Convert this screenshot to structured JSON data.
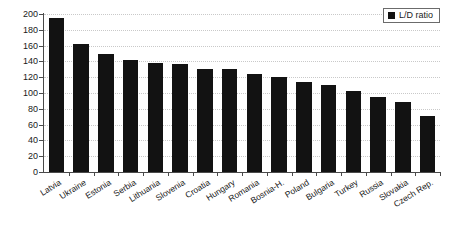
{
  "chart_data": {
    "type": "bar",
    "title": "",
    "xlabel": "",
    "ylabel": "",
    "ylim": [
      0,
      200
    ],
    "ytick_step": 20,
    "grid": true,
    "legend_position": "top-right",
    "series": [
      {
        "name": "L/D ratio",
        "color": "#121212",
        "values": [
          195,
          162,
          149,
          142,
          138,
          137,
          131,
          130,
          124,
          120,
          114,
          110,
          103,
          95,
          88,
          71
        ]
      }
    ],
    "categories": [
      "Latvia",
      "Ukraine",
      "Estonia",
      "Serbia",
      "Lithuania",
      "Slovenia",
      "Croatia",
      "Hungary",
      "Romania",
      "Bosnia-H.",
      "Poland",
      "Bulgaria",
      "Turkey",
      "Russia",
      "Slovakia",
      "Czech Rep."
    ],
    "ytick_labels": [
      "0",
      "20",
      "40",
      "60",
      "80",
      "100",
      "120",
      "140",
      "160",
      "180",
      "200"
    ],
    "ytick_values": [
      0,
      20,
      40,
      60,
      80,
      100,
      120,
      140,
      160,
      180,
      200
    ]
  },
  "legend": {
    "entries": [
      {
        "label": "L/D ratio",
        "color": "#121212",
        "marker": "square-marker"
      }
    ]
  },
  "colors": {
    "bar": "#121212",
    "axis": "#4a4a4a",
    "grid": "#c9c9c9",
    "text": "#1a1a1a",
    "background": "#ffffff"
  }
}
